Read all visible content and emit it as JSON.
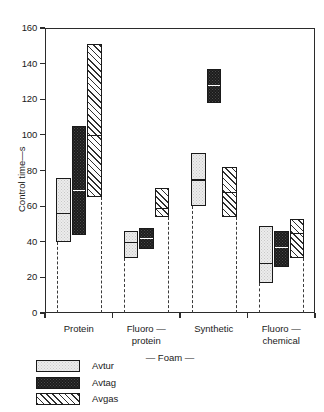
{
  "chart_data": {
    "type": "bar",
    "title": "",
    "subtitle": "",
    "xlabel": "— Foam —",
    "ylabel": "Control time—s",
    "ylim": [
      0,
      160
    ],
    "yticks": [
      0,
      20,
      40,
      60,
      80,
      100,
      120,
      140,
      160
    ],
    "grid": false,
    "legend_position": "below-left",
    "categories": [
      "Protein",
      "Fluoro—\nprotein",
      "Synthetic",
      "Fluoro—\nchemical"
    ],
    "series": [
      {
        "name": "Avtur",
        "low": [
          40,
          31,
          60,
          17
        ],
        "median": [
          56,
          40,
          75,
          28
        ],
        "high": [
          76,
          46,
          90,
          49
        ]
      },
      {
        "name": "Avtag",
        "low": [
          44,
          36,
          118,
          26
        ],
        "median": [
          69,
          42,
          128,
          37
        ],
        "high": [
          105,
          48,
          137,
          46
        ]
      },
      {
        "name": "Avgas",
        "low": [
          65,
          54,
          54,
          31
        ],
        "median": [
          100,
          59,
          68,
          45
        ],
        "high": [
          151,
          70,
          82,
          53
        ]
      }
    ]
  },
  "axis": {
    "y_label": "Control time—s",
    "y_ticks": [
      "0",
      "20",
      "40",
      "60",
      "80",
      "100",
      "120",
      "140",
      "160"
    ],
    "x_label": "— Foam —",
    "x_groups": [
      "Protein",
      "Fluoro —\nprotein",
      "Synthetic",
      "Fluoro —\nchemical"
    ]
  },
  "legend": {
    "items": [
      {
        "label": "Avtur",
        "pattern": "light-stipple",
        "color": "#ececec"
      },
      {
        "label": "Avtag",
        "pattern": "dark-solid",
        "color": "#1c1c1c"
      },
      {
        "label": "Avgas",
        "pattern": "diagonal-hatch",
        "color": "#ffffff"
      }
    ]
  }
}
